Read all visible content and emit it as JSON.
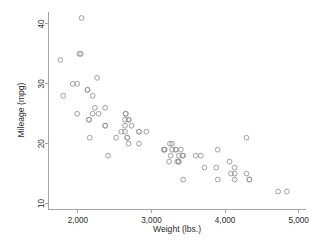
{
  "chart_data": {
    "type": "scatter",
    "title": "",
    "xlabel": "Weight (lbs.)",
    "ylabel": "Mileage (mpg)",
    "xlim": [
      1600,
      5100
    ],
    "ylim": [
      9,
      42
    ],
    "xticks": [
      2000,
      3000,
      4000,
      5000
    ],
    "xticklabels": [
      "2,000",
      "3,000",
      "4,000",
      "5,000"
    ],
    "yticks": [
      10,
      20,
      30,
      40
    ],
    "yticklabels": [
      "10",
      "20",
      "30",
      "40"
    ],
    "grid": false,
    "legend": null,
    "marker": "open-circle",
    "marker_color": "#8f8f96",
    "background_color": "#ffffff",
    "n_points": 74,
    "x": [
      2930,
      3350,
      2640,
      3250,
      4080,
      3670,
      2230,
      3280,
      3880,
      3400,
      4330,
      3900,
      4290,
      4330,
      3900,
      4290,
      3370,
      2730,
      4130,
      4060,
      4840,
      3720,
      3370,
      4130,
      2830,
      3370,
      4130,
      2690,
      3280,
      3430,
      3260,
      2690,
      3180,
      2590,
      3240,
      2520,
      3330,
      2200,
      2150,
      2670,
      2370,
      2130,
      2650,
      1800,
      1990,
      3600,
      3330,
      2640,
      2830,
      2260,
      3170,
      2830,
      2370,
      2280,
      3430,
      2640,
      2020,
      2160,
      2040,
      1930,
      1990,
      3170,
      2690,
      3420,
      2200,
      2150,
      2670,
      2370,
      2130,
      2650,
      1760,
      2050,
      2410,
      4720
    ],
    "y": [
      22,
      17,
      22,
      20,
      15,
      18,
      26,
      20,
      16,
      19,
      14,
      14,
      21,
      14,
      19,
      15,
      17,
      23,
      15,
      17,
      12,
      16,
      18,
      14,
      22,
      17,
      16,
      20,
      19,
      18,
      18,
      24,
      19,
      22,
      17,
      21,
      19,
      25,
      24,
      21,
      23,
      29,
      25,
      28,
      30,
      18,
      19,
      24,
      20,
      31,
      19,
      22,
      26,
      25,
      14,
      23,
      35,
      21,
      35,
      30,
      25,
      19,
      24,
      18,
      28,
      24,
      21,
      23,
      29,
      25,
      34,
      41,
      18,
      12
    ]
  },
  "axis": {
    "y_title": "Mileage (mpg)",
    "x_title": "Weight (lbs.)"
  }
}
